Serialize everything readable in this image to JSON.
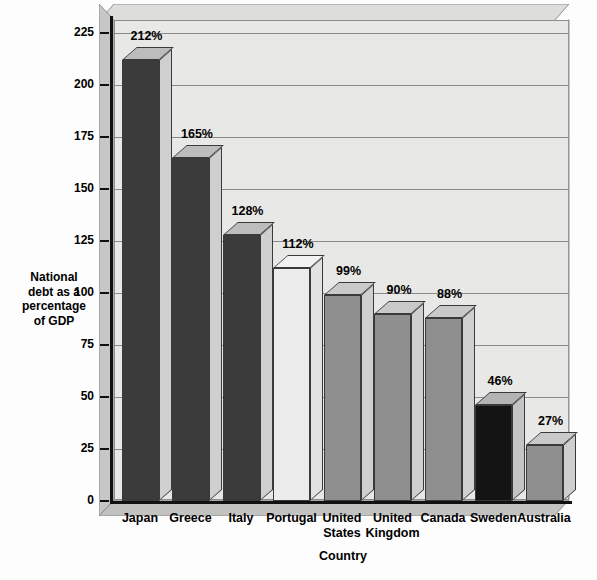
{
  "chart_data": {
    "type": "bar",
    "title": "",
    "subtitle": "",
    "xlabel": "Country",
    "ylabel": "National debt as a percentage of GDP",
    "ylabel_lines": [
      "National",
      "debt as a",
      "percentage",
      "of  GDP"
    ],
    "categories": [
      "Japan",
      "Greece",
      "Italy",
      "Portugal",
      "United States",
      "United Kingdom",
      "Canada",
      "Sweden",
      "Australia"
    ],
    "category_lines": [
      [
        "Japan"
      ],
      [
        "Greece"
      ],
      [
        "Italy"
      ],
      [
        "Portugal"
      ],
      [
        "United",
        "States"
      ],
      [
        "United",
        "Kingdom"
      ],
      [
        "Canada"
      ],
      [
        "Sweden"
      ],
      [
        "Australia"
      ]
    ],
    "values": [
      212,
      165,
      128,
      112,
      99,
      90,
      88,
      46,
      27
    ],
    "data_labels": [
      "212%",
      "165%",
      "128%",
      "112%",
      "99%",
      "90%",
      "88%",
      "46%",
      "27%"
    ],
    "bar_colors": [
      "#3b3b3b",
      "#3b3b3b",
      "#3b3b3b",
      "#ececec",
      "#8f8f8f",
      "#8f8f8f",
      "#8f8f8f",
      "#141414",
      "#8f8f8f"
    ],
    "bar_top_colors": [
      "#bdbdbd",
      "#bdbdbd",
      "#bdbdbd",
      "#f2f2f2",
      "#c9c9c9",
      "#c9c9c9",
      "#c9c9c9",
      "#b4b4b4",
      "#c9c9c9"
    ],
    "bar_side_colors": [
      "#cfcfcf",
      "#cfcfcf",
      "#cfcfcf",
      "#e2e2e2",
      "#cfcfcf",
      "#cfcfcf",
      "#cfcfcf",
      "#c4c4c4",
      "#cfcfcf"
    ],
    "ylim": [
      0,
      225
    ],
    "ytick_values": [
      0,
      25,
      50,
      75,
      100,
      125,
      150,
      175,
      200,
      225
    ],
    "ytick_labels": [
      "0",
      "25",
      "50",
      "75",
      "100",
      "125",
      "150",
      "175",
      "200",
      "225"
    ],
    "grid": true,
    "legend": "none",
    "plot_background": "#e8e8e6",
    "axis_color": "#111111",
    "gridline_color": "#8a8a8a"
  }
}
